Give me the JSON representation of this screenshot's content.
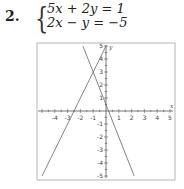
{
  "problem": {
    "number": "2.",
    "equations": [
      "5x + 2y = 1",
      "2x − y = −5"
    ]
  },
  "chart_data": {
    "type": "line",
    "title": "",
    "xlabel": "x",
    "ylabel": "y",
    "xlim": [
      -5,
      5
    ],
    "ylim": [
      -5,
      5
    ],
    "grid": false,
    "x_ticks": [
      -4,
      -3,
      -2,
      -1,
      1,
      2,
      3,
      4,
      5
    ],
    "y_ticks": [
      -5,
      -4,
      -3,
      -2,
      -1,
      1,
      2,
      3,
      4,
      5
    ],
    "series": [
      {
        "name": "5x + 2y = 1",
        "equation": "y = (1 - 5x)/2",
        "points": [
          [
            -1.8,
            5
          ],
          [
            2.2,
            -5
          ]
        ]
      },
      {
        "name": "2x − y = −5",
        "equation": "y = 2x + 5",
        "points": [
          [
            0,
            5
          ],
          [
            -5,
            -5
          ]
        ]
      }
    ],
    "intersection": [
      -1,
      3
    ]
  }
}
